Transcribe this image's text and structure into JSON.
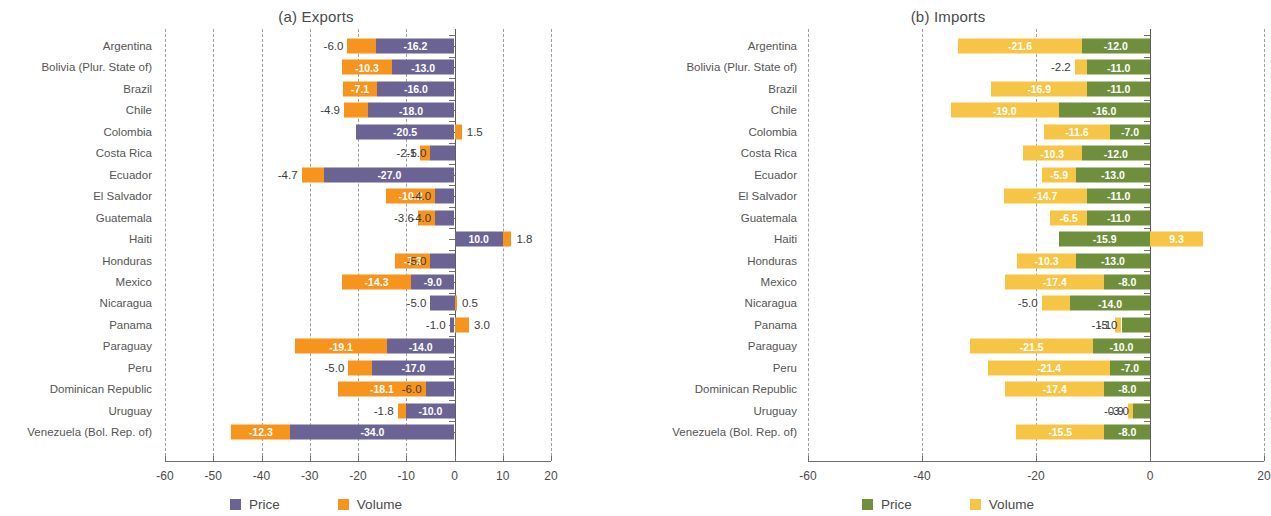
{
  "figure": {
    "colors": {
      "exports_price": "#6b6394",
      "exports_volume": "#f7941e",
      "imports_price": "#6f8f3d",
      "imports_volume": "#f7c545",
      "axis": "#6f6f6f",
      "grid": "#9aa0a6",
      "text": "#4a4a4a"
    },
    "categories": [
      "Argentina",
      "Bolivia (Plur. State of)",
      "Brazil",
      "Chile",
      "Colombia",
      "Costa Rica",
      "Ecuador",
      "El Salvador",
      "Guatemala",
      "Haiti",
      "Honduras",
      "Mexico",
      "Nicaragua",
      "Panama",
      "Paraguay",
      "Peru",
      "Dominican Republic",
      "Uruguay",
      "Venezuela (Bol. Rep. of)"
    ]
  },
  "panels": [
    {
      "id": "exports",
      "title": "(a) Exports",
      "legend": [
        {
          "label": "Price",
          "color": "#6b6394"
        },
        {
          "label": "Volume",
          "color": "#f7941e"
        }
      ],
      "ticks": [
        "-60",
        "-50",
        "-40",
        "-30",
        "-20",
        "-10",
        "0",
        "10",
        "20"
      ]
    },
    {
      "id": "imports",
      "title": "(b) Imports",
      "legend": [
        {
          "label": "Price",
          "color": "#6f8f3d"
        },
        {
          "label": "Volume",
          "color": "#f7c545"
        }
      ],
      "ticks": [
        "-60",
        "-40",
        "-20",
        "0",
        "20"
      ]
    }
  ],
  "chart_data": [
    {
      "type": "bar",
      "title": "(a) Exports",
      "orientation": "horizontal",
      "stacked": true,
      "xlabel": "",
      "ylabel": "",
      "xlim": [
        -60,
        20
      ],
      "xticks": [
        -60,
        -50,
        -40,
        -30,
        -20,
        -10,
        0,
        10,
        20
      ],
      "grid": true,
      "legend_position": "bottom",
      "categories": [
        "Argentina",
        "Bolivia (Plur. State of)",
        "Brazil",
        "Chile",
        "Colombia",
        "Costa Rica",
        "Ecuador",
        "El Salvador",
        "Guatemala",
        "Haiti",
        "Honduras",
        "Mexico",
        "Nicaragua",
        "Panama",
        "Paraguay",
        "Peru",
        "Dominican Republic",
        "Uruguay",
        "Venezuela (Bol. Rep. of)"
      ],
      "series": [
        {
          "name": "Price",
          "color": "#6b6394",
          "values": [
            -16.2,
            -13.0,
            -16.0,
            -18.0,
            -20.5,
            -5.0,
            -27.0,
            -4.0,
            -4.0,
            10.0,
            -5.0,
            -9.0,
            -5.0,
            -1.0,
            -14.0,
            -17.0,
            -6.0,
            -10.0,
            -34.0
          ],
          "labels": [
            "-16.2",
            "-13.0",
            "-16.0",
            "-18.0",
            "-20.5",
            "-5.0",
            "-27.0",
            "-4.0",
            "-4.0",
            "10.0",
            "-5.0",
            "-9.0",
            "-5.0",
            "-1.0",
            "-14.0",
            "-17.0",
            "-6.0",
            "-10.0",
            "-34.0"
          ]
        },
        {
          "name": "Volume",
          "color": "#f7941e",
          "values": [
            -6.0,
            -10.3,
            -7.1,
            -4.9,
            1.5,
            -2.1,
            -4.7,
            -10.2,
            -3.6,
            1.8,
            -7.3,
            -14.3,
            0.5,
            3.0,
            -19.1,
            -5.0,
            -18.1,
            -1.8,
            -12.3
          ],
          "labels": [
            "-6.0",
            "-10.3",
            "-7.1",
            "-4.9",
            "1.5",
            "-2.1",
            "-4.7",
            "-10.2",
            "-3.6",
            "1.8",
            "-7.3",
            "-14.3",
            "0.5",
            "3.0",
            "-19.1",
            "-5.0",
            "-18.1",
            "-1.8",
            "-12.3"
          ]
        }
      ]
    },
    {
      "type": "bar",
      "title": "(b) Imports",
      "orientation": "horizontal",
      "stacked": true,
      "xlabel": "",
      "ylabel": "",
      "xlim": [
        -60,
        20
      ],
      "xticks": [
        -60,
        -40,
        -20,
        0,
        20
      ],
      "grid": true,
      "legend_position": "bottom",
      "categories": [
        "Argentina",
        "Bolivia (Plur. State of)",
        "Brazil",
        "Chile",
        "Colombia",
        "Costa Rica",
        "Ecuador",
        "El Salvador",
        "Guatemala",
        "Haiti",
        "Honduras",
        "Mexico",
        "Nicaragua",
        "Panama",
        "Paraguay",
        "Peru",
        "Dominican Republic",
        "Uruguay",
        "Venezuela (Bol. Rep. of)"
      ],
      "series": [
        {
          "name": "Price",
          "color": "#6f8f3d",
          "values": [
            -12.0,
            -11.0,
            -11.0,
            -16.0,
            -7.0,
            -12.0,
            -13.0,
            -11.0,
            -11.0,
            -15.9,
            -13.0,
            -8.0,
            -14.0,
            -5.0,
            -10.0,
            -7.0,
            -8.0,
            -3.0,
            -8.0
          ],
          "labels": [
            "-12.0",
            "-11.0",
            "-11.0",
            "-16.0",
            "-7.0",
            "-12.0",
            "-13.0",
            "-11.0",
            "-11.0",
            "-15.9",
            "-13.0",
            "-8.0",
            "-14.0",
            "-5.0",
            "-10.0",
            "-7.0",
            "-8.0",
            "-3.0",
            "-8.0"
          ]
        },
        {
          "name": "Volume",
          "color": "#f7c545",
          "values": [
            -21.6,
            -2.2,
            -16.9,
            -19.0,
            -11.6,
            -10.3,
            -5.9,
            -14.7,
            -6.5,
            9.3,
            -10.3,
            -17.4,
            -5.0,
            -1.1,
            -21.5,
            -21.4,
            -17.4,
            -0.9,
            -15.5
          ],
          "labels": [
            "-21.6",
            "-2.2",
            "-16.9",
            "-19.0",
            "-11.6",
            "-10.3",
            "-5.9",
            "-14.7",
            "-6.5",
            "9.3",
            "-10.3",
            "-17.4",
            "-5.0",
            "-1.1",
            "-21.5",
            "-21.4",
            "-17.4",
            "-0.9",
            "-15.5"
          ]
        }
      ]
    }
  ]
}
